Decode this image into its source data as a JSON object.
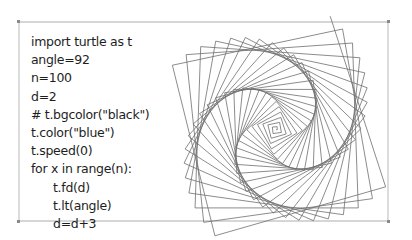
{
  "code": {
    "lines": [
      {
        "text": "import turtle as t",
        "indent": 0
      },
      {
        "text": "angle=92",
        "indent": 0
      },
      {
        "text": "n=100",
        "indent": 0
      },
      {
        "text": "d=2",
        "indent": 0
      },
      {
        "text": "# t.bgcolor(\"black\")",
        "indent": 0
      },
      {
        "text": "t.color(\"blue\")",
        "indent": 0
      },
      {
        "text": "t.speed(0)",
        "indent": 0
      },
      {
        "text": "for x in range(n):",
        "indent": 0
      },
      {
        "text": "t.fd(d)",
        "indent": 1
      },
      {
        "text": "t.lt(angle)",
        "indent": 1
      },
      {
        "text": "d=d+3",
        "indent": 1
      }
    ]
  },
  "figure": {
    "type": "turtle-square-spiral",
    "angle": 92,
    "n": 100,
    "d_start": 2,
    "d_step": 3,
    "scale": 0.6,
    "center_x": 279,
    "center_y": 126,
    "stroke": "#6e6e6e"
  },
  "colors": {
    "frame_border": "#d6d6d6",
    "corner": "#8a8a8a",
    "text": "#1e1e1e"
  }
}
